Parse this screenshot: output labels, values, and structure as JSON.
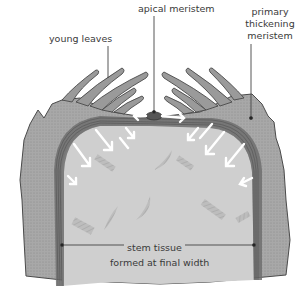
{
  "diagram": {
    "labels": {
      "apical_meristem": "apical meristem",
      "young_leaves": "young leaves",
      "primary_thickening_meristem": [
        "primary",
        "thickening",
        "meristem"
      ],
      "stem_tissue_line1": "stem tissue",
      "stem_tissue_line2": "formed at final width"
    },
    "colors": {
      "background": "#ffffff",
      "outer_tissue": "#a9a9a9",
      "inner_tissue": "#cfcfcf",
      "meristem_band": "#6e6e6e",
      "outline": "#4a4a4a",
      "arrows": "#ffffff",
      "label_text": "#3a3a3a",
      "leader_lines": "#444444"
    },
    "arrows": {
      "count_left": 5,
      "count_right": 5,
      "apex_horizontal": 2,
      "color_name": "white"
    }
  }
}
